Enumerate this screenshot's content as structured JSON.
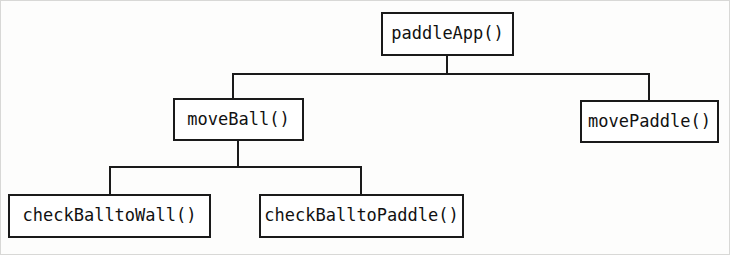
{
  "diagram": {
    "type": "structure-chart",
    "orientation": "top-down",
    "style": {
      "line_color": "#1a1a1a",
      "box_fill": "#ffffff",
      "text_color": "#111111",
      "background": "#fdfdfc"
    },
    "nodes": [
      {
        "id": "paddleApp",
        "label": "paddleApp()",
        "level": 0
      },
      {
        "id": "moveBall",
        "label": "moveBall()",
        "level": 1
      },
      {
        "id": "movePaddle",
        "label": "movePaddle()",
        "level": 1
      },
      {
        "id": "checkBalltoWall",
        "label": "checkBalltoWall()",
        "level": 2
      },
      {
        "id": "checkBalltoPaddle",
        "label": "checkBalltoPaddle()",
        "level": 2
      }
    ],
    "edges": [
      {
        "from": "paddleApp",
        "to": "moveBall"
      },
      {
        "from": "paddleApp",
        "to": "movePaddle"
      },
      {
        "from": "moveBall",
        "to": "checkBalltoWall"
      },
      {
        "from": "moveBall",
        "to": "checkBalltoPaddle"
      }
    ]
  }
}
